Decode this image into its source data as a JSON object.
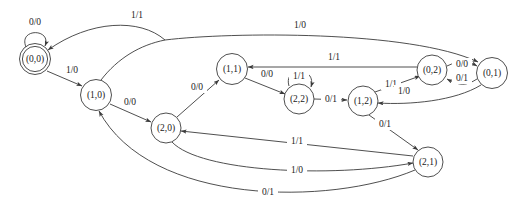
{
  "diagram": {
    "kind": "finite-state-machine",
    "notation": "input/output",
    "accent_color": "#3b3b3b",
    "background_color": "#ffffff",
    "states": [
      {
        "id": "s00",
        "label": "(0,0)",
        "x": 35,
        "y": 59,
        "r": 15.5,
        "accepting": true
      },
      {
        "id": "s10",
        "label": "(1,0)",
        "x": 96,
        "y": 95,
        "r": 15.5,
        "accepting": false
      },
      {
        "id": "s20",
        "label": "(2,0)",
        "x": 166,
        "y": 128,
        "r": 15.0,
        "accepting": false
      },
      {
        "id": "s11",
        "label": "(1,1)",
        "x": 232,
        "y": 69,
        "r": 15.5,
        "accepting": false
      },
      {
        "id": "s22",
        "label": "(2,2)",
        "x": 299,
        "y": 99,
        "r": 15.0,
        "accepting": false
      },
      {
        "id": "s12",
        "label": "(1,2)",
        "x": 363,
        "y": 101,
        "r": 15.0,
        "accepting": false
      },
      {
        "id": "s02",
        "label": "(0,2)",
        "x": 432,
        "y": 70,
        "r": 15.0,
        "accepting": false
      },
      {
        "id": "s01",
        "label": "(0,1)",
        "x": 492,
        "y": 73,
        "r": 15.5,
        "accepting": false
      },
      {
        "id": "s21",
        "label": "(2,1)",
        "x": 428,
        "y": 162,
        "r": 15.0,
        "accepting": false
      }
    ],
    "transitions": [
      {
        "from": "s00",
        "to": "s00",
        "label": "0/0",
        "label_x": 35,
        "label_y": 22
      },
      {
        "from": "s00",
        "to": "s10",
        "label": "1/0",
        "label_x": 72,
        "label_y": 70
      },
      {
        "from": "s10",
        "to": "s00",
        "label": "1/1",
        "label_x": 137,
        "label_y": 15
      },
      {
        "from": "s10",
        "to": "s20",
        "label": "0/0",
        "label_x": 130,
        "label_y": 102
      },
      {
        "from": "s10",
        "to": "s01",
        "label": "1/0",
        "label_x": 300,
        "label_y": 25
      },
      {
        "from": "s20",
        "to": "s11",
        "label": "0/0",
        "label_x": 197,
        "label_y": 87
      },
      {
        "from": "s11",
        "to": "s22",
        "label": "0/0",
        "label_x": 267,
        "label_y": 74
      },
      {
        "from": "s22",
        "to": "s22",
        "label": "1/1",
        "label_x": 299,
        "label_y": 76
      },
      {
        "from": "s22",
        "to": "s12",
        "label": "0/1",
        "label_x": 331,
        "label_y": 99
      },
      {
        "from": "s02",
        "to": "s11",
        "label": "1/1",
        "label_x": 334,
        "label_y": 57
      },
      {
        "from": "s12",
        "to": "s02",
        "label": "1/1",
        "label_x": 391,
        "label_y": 84
      },
      {
        "from": "s02",
        "to": "s01",
        "label": "0/0",
        "label_x": 462,
        "label_y": 64
      },
      {
        "from": "s01",
        "to": "s02",
        "label": "0/1",
        "label_x": 462,
        "label_y": 78
      },
      {
        "from": "s01",
        "to": "s12",
        "label": "1/0",
        "label_x": 404,
        "label_y": 91
      },
      {
        "from": "s12",
        "to": "s21",
        "label": "0/1",
        "label_x": 385,
        "label_y": 124
      },
      {
        "from": "s21",
        "to": "s20",
        "label": "1/1",
        "label_x": 297,
        "label_y": 141
      },
      {
        "from": "s20",
        "to": "s21",
        "label": "1/0",
        "label_x": 297,
        "label_y": 170
      },
      {
        "from": "s21",
        "to": "s10",
        "label": "0/1",
        "label_x": 268,
        "label_y": 192
      }
    ]
  }
}
